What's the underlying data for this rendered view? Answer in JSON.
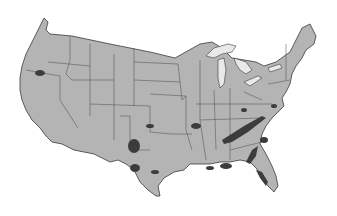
{
  "map": {
    "subject": "Contiguous United States",
    "style": "grayscale",
    "colors": {
      "background": "#ffffff",
      "land": "#b4b4b4",
      "borders": "#3a3a3a",
      "lakes": "#e9e9e9",
      "highlighted_regions": "#3c3c3c"
    },
    "features": [
      "state-borders",
      "great-lakes",
      "dark-shaded-regions"
    ],
    "shaded_regions": [
      {
        "name": "southern-oregon"
      },
      {
        "name": "west-texas"
      },
      {
        "name": "central-texas"
      },
      {
        "name": "appalachia-tennessee"
      },
      {
        "name": "alabama-georgia"
      },
      {
        "name": "carolinas"
      },
      {
        "name": "florida"
      },
      {
        "name": "arkansas-ozarks"
      },
      {
        "name": "gulf-coast"
      }
    ]
  }
}
